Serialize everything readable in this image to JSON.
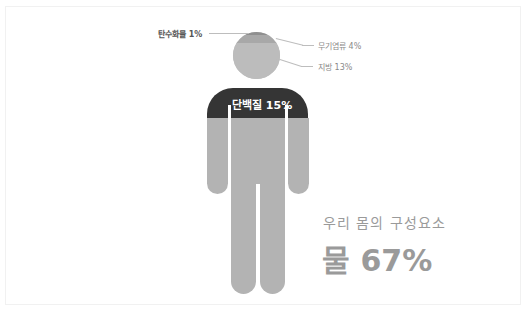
{
  "diagram": {
    "title": "우리 몸의 구성요소",
    "headline": "물 67%",
    "components": [
      {
        "name": "탄수화물",
        "percent": 1,
        "label": "탄수화물 1%",
        "location": "head-top"
      },
      {
        "name": "무기염류",
        "percent": 4,
        "label": "무기염류 4%",
        "location": "head-upper"
      },
      {
        "name": "지방",
        "percent": 13,
        "label": "지방 13%",
        "location": "head-lower"
      },
      {
        "name": "단백질",
        "percent": 15,
        "label": "단백질 15%",
        "location": "shoulders"
      },
      {
        "name": "물",
        "percent": 67,
        "label": "물 67%",
        "location": "body"
      }
    ],
    "colors": {
      "carbohydrate": "#8f8f8f",
      "minerals": "#a9a9a9",
      "fat": "#bababa",
      "protein": "#353535",
      "water": "#b3b3b3",
      "text": "#9a9a9a"
    }
  }
}
